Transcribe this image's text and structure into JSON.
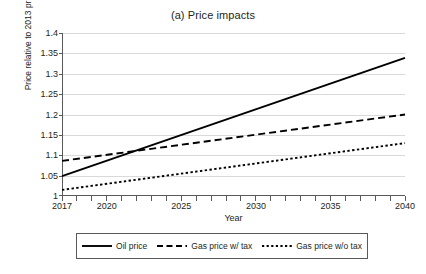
{
  "chart_data": {
    "type": "line",
    "title": "(a) Price impacts",
    "xlabel": "Year",
    "ylabel": "Price relative to 2013 price",
    "xlim": [
      2017,
      2040
    ],
    "ylim": [
      1,
      1.4
    ],
    "grid": true,
    "grid_axis": "y",
    "legend_position": "bottom",
    "x_tick_labels": [
      "2017",
      "2020",
      "2025",
      "2030",
      "2035",
      "2040"
    ],
    "x_tick_values": [
      2017,
      2020,
      2025,
      2030,
      2035,
      2040
    ],
    "x_minor_ticks": [
      2017,
      2018,
      2019,
      2020,
      2021,
      2022,
      2023,
      2024,
      2025,
      2026,
      2027,
      2028,
      2029,
      2030,
      2031,
      2032,
      2033,
      2034,
      2035,
      2036,
      2037,
      2038,
      2039,
      2040
    ],
    "y_tick_labels": [
      "1",
      "1.05",
      "1.1",
      "1.15",
      "1.2",
      "1.25",
      "1.3",
      "1.35",
      "1.4"
    ],
    "y_tick_values": [
      1,
      1.05,
      1.1,
      1.15,
      1.2,
      1.25,
      1.3,
      1.35,
      1.4
    ],
    "x": [
      2017,
      2040
    ],
    "series": [
      {
        "name": "Oil price",
        "style": "solid",
        "color": "#000000",
        "x": [
          2017,
          2040
        ],
        "values": [
          1.05,
          1.34
        ]
      },
      {
        "name": "Gas price w/ tax",
        "style": "dashed",
        "color": "#000000",
        "x": [
          2017,
          2040
        ],
        "values": [
          1.087,
          1.201
        ]
      },
      {
        "name": "Gas price w/o tax",
        "style": "dotted",
        "color": "#000000",
        "x": [
          2017,
          2040
        ],
        "values": [
          1.016,
          1.131
        ]
      }
    ]
  },
  "chart": {
    "title": "(a) Price impacts",
    "x_axis_title": "Year",
    "y_axis_title": "Price relative to 2013 price",
    "y_labels": [
      "1.4",
      "1.35",
      "1.3",
      "1.25",
      "1.2",
      "1.15",
      "1.1",
      "1.05",
      "1"
    ],
    "x_labels": [
      "2017",
      "2020",
      "2025",
      "2030",
      "2035",
      "2040"
    ]
  },
  "legend": {
    "items": [
      {
        "label": "Oil price",
        "style": "solid"
      },
      {
        "label": "Gas price w/ tax",
        "style": "dashed"
      },
      {
        "label": "Gas price w/o tax",
        "style": "dotted"
      }
    ]
  },
  "colors": {
    "ink": "#231f20",
    "line": "#000000",
    "grid": "#d9d9d9",
    "axis": "#58595b",
    "background": "#ffffff"
  }
}
